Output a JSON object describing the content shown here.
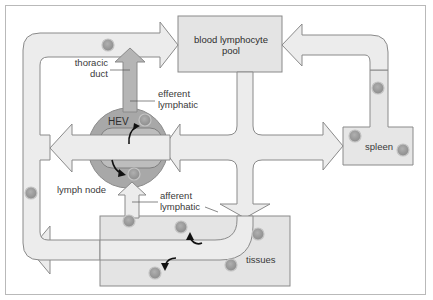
{
  "diagram": {
    "labels": {
      "blood_pool_line1": "blood lymphocyte",
      "blood_pool_line2": "pool",
      "thoracic_line1": "thoracic",
      "thoracic_line2": "duct",
      "efferent_line1": "efferent",
      "efferent_line2": "lymphatic",
      "hev": "HEV",
      "lymph_node": "lymph node",
      "afferent_line1": "afferent",
      "afferent_line2": "lymphatic",
      "spleen": "spleen",
      "tissues": "tissues"
    },
    "colors": {
      "box_fill": "#e6e6e6",
      "arrow_fill": "#ececec",
      "stroke": "#8a8a8a",
      "node_fill": "#a9a9a9",
      "cell_fill": "#9a9a9a",
      "cell_ring": "#c8c8c8"
    }
  }
}
